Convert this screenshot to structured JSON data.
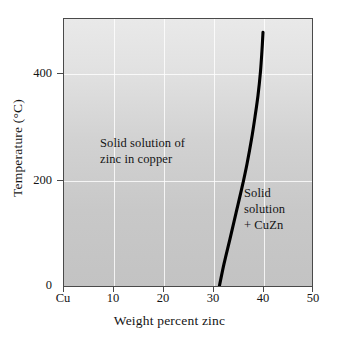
{
  "chart_data": {
    "type": "line",
    "title": "",
    "subtitle": "",
    "xlabel": "Weight percent zinc",
    "ylabel": "Temperature (°C)",
    "xlim": [
      0,
      50
    ],
    "ylim": [
      0,
      503
    ],
    "grid": true,
    "legend_position": "none",
    "x_ticks": [
      {
        "value": 0,
        "label": "Cu"
      },
      {
        "value": 10,
        "label": "10"
      },
      {
        "value": 20,
        "label": "20"
      },
      {
        "value": 30,
        "label": "30"
      },
      {
        "value": 40,
        "label": "40"
      },
      {
        "value": 50,
        "label": "50"
      }
    ],
    "y_ticks": [
      {
        "value": 0,
        "label": "0"
      },
      {
        "value": 200,
        "label": "200"
      },
      {
        "value": 400,
        "label": "400"
      }
    ],
    "series": [
      {
        "name": "alpha/(alpha + beta) solvus boundary",
        "x": [
          31.0,
          32.0,
          33.2,
          34.4,
          35.6,
          36.6,
          37.5,
          38.2,
          38.8,
          39.3,
          39.6,
          39.8
        ],
        "y": [
          0,
          45,
          92,
          140,
          188,
          232,
          278,
          320,
          360,
          405,
          445,
          478
        ]
      }
    ],
    "annotations": [
      {
        "name": "alpha-phase-region",
        "text": "Solid solution of\nzinc in copper",
        "x": 14.5,
        "y": 265
      },
      {
        "name": "two-phase-region",
        "text": "Solid\nsolution\n+ CuZn",
        "x": 43.5,
        "y": 172
      }
    ],
    "style": {
      "plot_background_top": "#e9e9e9",
      "plot_background_bottom": "#c3c3c3",
      "gridline_color": "#ffffff",
      "curve_color": "#000000",
      "frame_color": "#4a4a4a",
      "text_color": "#141414",
      "page_background": "#ffffff"
    }
  }
}
